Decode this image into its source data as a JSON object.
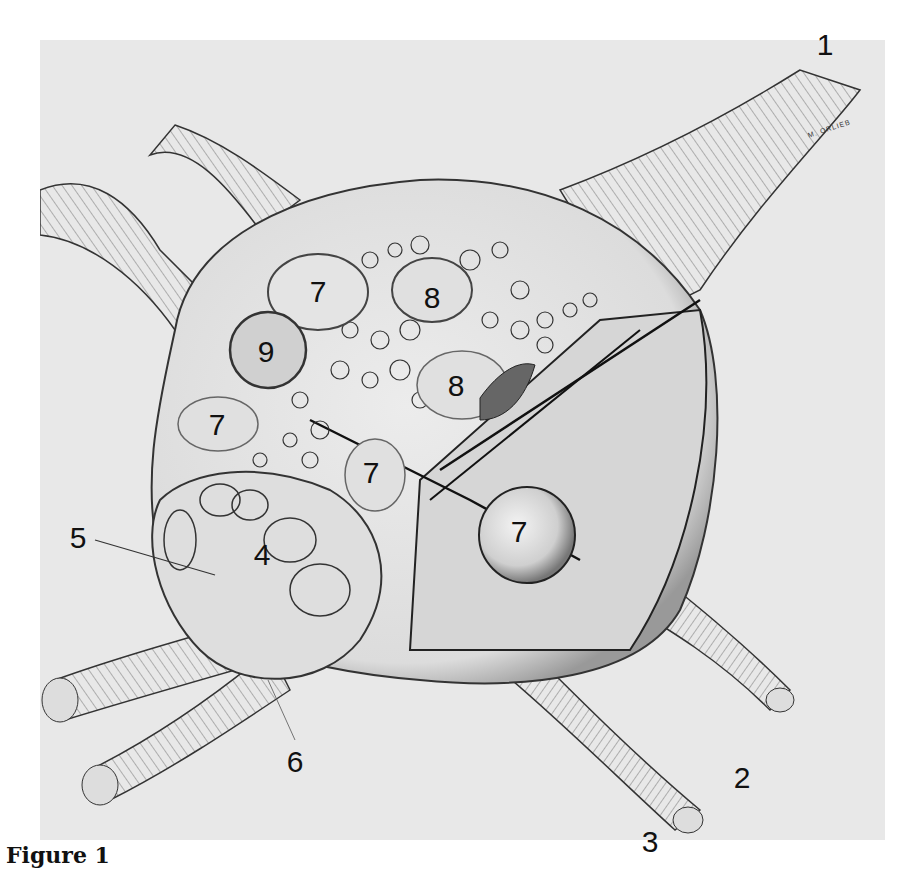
{
  "figure": {
    "caption": "Figure 1",
    "artist_signature": "M. ORLIEB",
    "labels": [
      {
        "id": "1",
        "text": "1",
        "x": 825,
        "y": 45
      },
      {
        "id": "2",
        "text": "2",
        "x": 742,
        "y": 778
      },
      {
        "id": "3",
        "text": "3",
        "x": 650,
        "y": 842
      },
      {
        "id": "4",
        "text": "4",
        "x": 262,
        "y": 555
      },
      {
        "id": "5",
        "text": "5",
        "x": 78,
        "y": 538
      },
      {
        "id": "6",
        "text": "6",
        "x": 295,
        "y": 762
      },
      {
        "id": "7a",
        "text": "7",
        "x": 318,
        "y": 292
      },
      {
        "id": "7b",
        "text": "7",
        "x": 217,
        "y": 425
      },
      {
        "id": "7c",
        "text": "7",
        "x": 371,
        "y": 473
      },
      {
        "id": "7d",
        "text": "7",
        "x": 519,
        "y": 532
      },
      {
        "id": "8a",
        "text": "8",
        "x": 432,
        "y": 298
      },
      {
        "id": "8b",
        "text": "8",
        "x": 456,
        "y": 386
      },
      {
        "id": "9",
        "text": "9",
        "x": 266,
        "y": 352
      }
    ]
  }
}
